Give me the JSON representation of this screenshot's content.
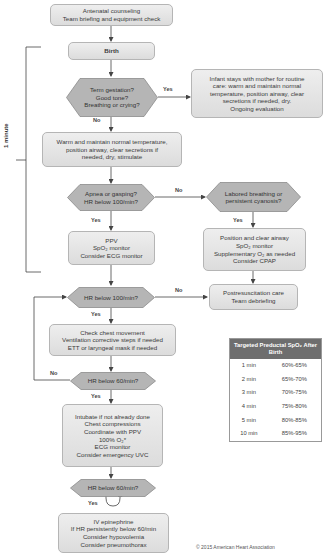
{
  "side_bracket": {
    "label": "1 minute"
  },
  "nodes": {
    "antenatal": [
      "Antenatal counseling",
      "Team briefing and equipment check"
    ],
    "birth": [
      "Birth"
    ],
    "q_term": [
      "Term gestation?",
      "Good tone?",
      "Breathing or crying?"
    ],
    "routine_care": [
      "Infant stays with mother for routine",
      "care: warm and maintain normal",
      "temperature, position airway, clear",
      "secretions if needed, dry.",
      "Ongoing evaluation"
    ],
    "warm": [
      "Warm and maintain normal temperature,",
      "position airway, clear secretions if",
      "needed, dry, stimulate"
    ],
    "q_apnea": [
      "Apnea or gasping?",
      "HR below 100/min?"
    ],
    "q_labored": [
      "Labored breathing or",
      "persistent cyanosis?"
    ],
    "ppv": [
      "PPV",
      "SpO₂ monitor",
      "Consider ECG monitor"
    ],
    "position": [
      "Position and clear airway",
      "SpO₂ monitor",
      "Supplementary O₂ as needed",
      "Consider CPAP"
    ],
    "q_hr100": [
      "HR below 100/min?"
    ],
    "postresus": [
      "Postresuscitation care",
      "Team debriefing"
    ],
    "chest": [
      "Check chest movement",
      "Ventilation corrective steps if needed",
      "ETT or laryngeal mask if needed"
    ],
    "q_hr60a": [
      "HR below 60/min?"
    ],
    "intubate": [
      "Intubate if not already done",
      "Chest compressions",
      "Coordinate with PPV",
      "100% O₂*",
      "ECG monitor",
      "Consider emergency UVC"
    ],
    "q_hr60b": [
      "HR below 60/min?"
    ],
    "epi": [
      "IV epinephrine",
      "If HR persistently below 60/min",
      "Consider hypovolemia",
      "Consider pneumothorax"
    ]
  },
  "edge_labels": {
    "term_yes": "Yes",
    "term_no": "No",
    "apnea_no": "No",
    "apnea_yes": "Yes",
    "labored_yes": "Yes",
    "hr100_no": "No",
    "hr100_yes": "Yes",
    "hr60a_no": "No",
    "hr60a_yes": "Yes",
    "hr60b_yes": "Yes"
  },
  "spo2_table": {
    "title": "Targeted Preductal SpO₂ After Birth",
    "rows": [
      {
        "time": "1 min",
        "range": "60%-65%"
      },
      {
        "time": "2 min",
        "range": "65%-70%"
      },
      {
        "time": "3 min",
        "range": "70%-75%"
      },
      {
        "time": "4 min",
        "range": "75%-80%"
      },
      {
        "time": "5 min",
        "range": "80%-85%"
      },
      {
        "time": "10 min",
        "range": "85%-95%"
      }
    ]
  },
  "copyright": "© 2015 American Heart Association",
  "colors": {
    "box_fill": "#e6e6e6",
    "hex_fill": "#b8b8b8",
    "line": "#444444",
    "table_header": "#6e6e6e"
  }
}
